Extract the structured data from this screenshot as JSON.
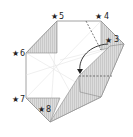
{
  "diagram": {
    "type": "origami-fold-step",
    "colors": {
      "paper": "#ffffff",
      "shade": "#d8d8d8",
      "stripe": "#c4c4c4",
      "edge": "#8a8a8a",
      "crease": "#e2e2e2",
      "arrow": "#222222"
    },
    "markers": [
      {
        "id": "3",
        "label": "3",
        "symbol": "★"
      },
      {
        "id": "4",
        "label": "4",
        "symbol": "★"
      },
      {
        "id": "5",
        "label": "5",
        "symbol": "★"
      },
      {
        "id": "6",
        "label": "6",
        "symbol": "★"
      },
      {
        "id": "7",
        "label": "7",
        "symbol": "★"
      },
      {
        "id": "8",
        "label": "8",
        "symbol": "★"
      }
    ],
    "arrow": {
      "type": "fold-arrow",
      "from": "3",
      "direction": "down-left"
    },
    "fold_lines": [
      "valley-fold-top",
      "valley-fold-middle"
    ]
  }
}
